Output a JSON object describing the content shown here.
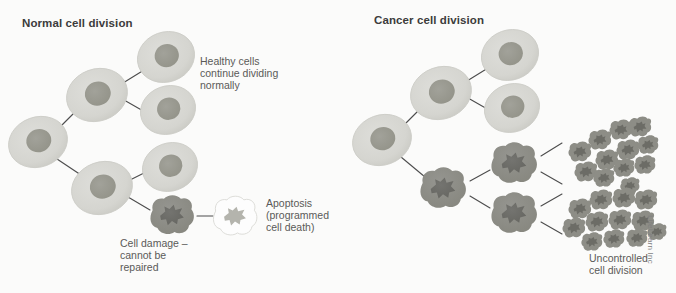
{
  "figure": {
    "background_color": "#fbfbfa",
    "credit": "LifeLearn Inc",
    "width": 676,
    "height": 293
  },
  "palette": {
    "healthy_cytoplasm": "#d6d6d1",
    "healthy_cytoplasm_edge": "#cbcbc5",
    "healthy_nucleus": "#98988f",
    "damaged_cytoplasm": "#8d8d86",
    "damaged_nucleus": "#6c6c66",
    "apoptotic_fill": "#fdfdfd",
    "apoptotic_outline": "#d9d9d4",
    "apoptotic_nucleus": "#b4b4ad",
    "connector_line": "#4c4c4c",
    "title_text": "#3c3c3c",
    "caption_text": "#5a5a58",
    "credit_text": "#808080"
  },
  "panels": [
    {
      "id": "normal",
      "title": "Normal cell division",
      "captions": [
        {
          "id": "healthy",
          "text": "Healthy cells\ncontinue dividing\nnormally"
        },
        {
          "id": "apoptosis",
          "text": "Apoptosis\n(programmed\ncell death)"
        },
        {
          "id": "damage",
          "text": "Cell damage –\ncannot be\nrepaired"
        }
      ],
      "cells": [
        {
          "name": "parent-cell",
          "type": "healthy",
          "cx": 38,
          "cy": 142,
          "rx": 30,
          "ry": 25,
          "rot": -20
        },
        {
          "name": "daughter-upper",
          "type": "healthy",
          "cx": 97,
          "cy": 95,
          "rx": 31,
          "ry": 26,
          "rot": -20
        },
        {
          "name": "daughter-lower",
          "type": "healthy",
          "cx": 102,
          "cy": 188,
          "rx": 31,
          "ry": 26,
          "rot": -20
        },
        {
          "name": "grandchild-1",
          "type": "healthy",
          "cx": 166,
          "cy": 57,
          "rx": 29,
          "ry": 25,
          "rot": -20
        },
        {
          "name": "grandchild-2",
          "type": "healthy",
          "cx": 168,
          "cy": 110,
          "rx": 28,
          "ry": 24,
          "rot": -20
        },
        {
          "name": "grandchild-3",
          "type": "healthy",
          "cx": 170,
          "cy": 167,
          "rx": 28,
          "ry": 24,
          "rot": -20
        },
        {
          "name": "damaged-cell",
          "type": "damaged",
          "cx": 172,
          "cy": 215,
          "rx": 26,
          "ry": 21,
          "rot": 0
        },
        {
          "name": "apoptotic-cell",
          "type": "apoptotic",
          "cx": 235,
          "cy": 216,
          "rx": 25,
          "ry": 21,
          "rot": 0
        }
      ],
      "connectors": [
        {
          "name": "parent-to-upper",
          "x1": 61,
          "y1": 126,
          "x2": 77,
          "y2": 110
        },
        {
          "name": "parent-to-lower",
          "x1": 57,
          "y1": 159,
          "x2": 84,
          "y2": 177
        },
        {
          "name": "upper-to-gc1",
          "x1": 123,
          "y1": 83,
          "x2": 144,
          "y2": 70
        },
        {
          "name": "upper-to-gc2",
          "x1": 124,
          "y1": 100,
          "x2": 145,
          "y2": 112
        },
        {
          "name": "lower-to-gc3",
          "x1": 128,
          "y1": 181,
          "x2": 148,
          "y2": 171
        },
        {
          "name": "lower-to-damaged",
          "x1": 128,
          "y1": 197,
          "x2": 150,
          "y2": 210
        },
        {
          "name": "damaged-to-apoptotic",
          "x1": 197,
          "y1": 216,
          "x2": 213,
          "y2": 216
        }
      ]
    },
    {
      "id": "cancer",
      "title": "Cancer cell division",
      "captions": [
        {
          "id": "uncontrolled",
          "text": "Uncontrolled\ncell division"
        }
      ],
      "cells": [
        {
          "name": "parent-cell",
          "type": "healthy",
          "cx": 382,
          "cy": 140,
          "rx": 30,
          "ry": 25,
          "rot": -20
        },
        {
          "name": "daughter-upper",
          "type": "healthy",
          "cx": 441,
          "cy": 93,
          "rx": 31,
          "ry": 26,
          "rot": -20
        },
        {
          "name": "daughter-lower",
          "type": "damaged",
          "cx": 443,
          "cy": 188,
          "rx": 27,
          "ry": 22,
          "rot": 0
        },
        {
          "name": "grandchild-1",
          "type": "healthy",
          "cx": 510,
          "cy": 55,
          "rx": 29,
          "ry": 25,
          "rot": -20
        },
        {
          "name": "grandchild-2",
          "type": "healthy",
          "cx": 512,
          "cy": 108,
          "rx": 28,
          "ry": 24,
          "rot": -20
        },
        {
          "name": "cancer-cell-upper",
          "type": "damaged",
          "cx": 514,
          "cy": 163,
          "rx": 27,
          "ry": 22,
          "rot": 0
        },
        {
          "name": "cancer-cell-lower",
          "type": "damaged",
          "cx": 514,
          "cy": 213,
          "rx": 27,
          "ry": 22,
          "rot": 0
        }
      ],
      "connectors": [
        {
          "name": "parent-to-upper",
          "x1": 405,
          "y1": 124,
          "x2": 421,
          "y2": 108
        },
        {
          "name": "parent-to-lower",
          "x1": 401,
          "y1": 157,
          "x2": 425,
          "y2": 177
        },
        {
          "name": "upper-to-gc1",
          "x1": 467,
          "y1": 81,
          "x2": 488,
          "y2": 68
        },
        {
          "name": "upper-to-gc2",
          "x1": 468,
          "y1": 98,
          "x2": 489,
          "y2": 110
        },
        {
          "name": "lower-to-cancer-upper",
          "x1": 470,
          "y1": 181,
          "x2": 490,
          "y2": 170
        },
        {
          "name": "lower-to-cancer-lower",
          "x1": 470,
          "y1": 196,
          "x2": 490,
          "y2": 208
        },
        {
          "name": "cancer-upper-to-cluster-a",
          "x1": 541,
          "y1": 156,
          "x2": 562,
          "y2": 143
        },
        {
          "name": "cancer-upper-to-cluster-b",
          "x1": 541,
          "y1": 172,
          "x2": 562,
          "y2": 184
        },
        {
          "name": "cancer-lower-to-cluster-c",
          "x1": 541,
          "y1": 206,
          "x2": 562,
          "y2": 194
        },
        {
          "name": "cancer-lower-to-cluster-d",
          "x1": 541,
          "y1": 222,
          "x2": 562,
          "y2": 234
        }
      ],
      "clusters": [
        {
          "name": "cluster-upper",
          "cells": [
            {
              "cx": 580,
              "cy": 152,
              "r": 13
            },
            {
              "cx": 600,
              "cy": 140,
              "r": 13
            },
            {
              "cx": 621,
              "cy": 130,
              "r": 13
            },
            {
              "cx": 640,
              "cy": 127,
              "r": 13
            },
            {
              "cx": 586,
              "cy": 172,
              "r": 13
            },
            {
              "cx": 607,
              "cy": 160,
              "r": 13
            },
            {
              "cx": 628,
              "cy": 150,
              "r": 13
            },
            {
              "cx": 648,
              "cy": 145,
              "r": 12
            },
            {
              "cx": 604,
              "cy": 178,
              "r": 12
            },
            {
              "cx": 624,
              "cy": 168,
              "r": 12
            },
            {
              "cx": 645,
              "cy": 165,
              "r": 12
            },
            {
              "cx": 630,
              "cy": 186,
              "r": 11
            }
          ]
        },
        {
          "name": "cluster-lower",
          "cells": [
            {
              "cx": 580,
              "cy": 209,
              "r": 13
            },
            {
              "cx": 601,
              "cy": 200,
              "r": 13
            },
            {
              "cx": 624,
              "cy": 198,
              "r": 13
            },
            {
              "cx": 646,
              "cy": 200,
              "r": 13
            },
            {
              "cx": 574,
              "cy": 228,
              "r": 13
            },
            {
              "cx": 597,
              "cy": 222,
              "r": 13
            },
            {
              "cx": 620,
              "cy": 220,
              "r": 13
            },
            {
              "cx": 643,
              "cy": 221,
              "r": 13
            },
            {
              "cx": 592,
              "cy": 242,
              "r": 12
            },
            {
              "cx": 614,
              "cy": 239,
              "r": 12
            },
            {
              "cx": 637,
              "cy": 238,
              "r": 12
            },
            {
              "cx": 657,
              "cy": 232,
              "r": 11
            }
          ]
        }
      ]
    }
  ]
}
